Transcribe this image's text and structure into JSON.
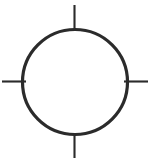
{
  "figure": {
    "name": "circle-with-cardinal-tick-marks",
    "type": "line-drawing",
    "canvas": {
      "width": 150,
      "height": 161,
      "background_color": "#ffffff"
    },
    "stroke_color": "#2b2b2b",
    "fill_color": "none",
    "circle": {
      "name": "outline-circle",
      "center_x": 75,
      "center_y": 82,
      "radius": 52.5,
      "stroke_width": 3.2,
      "fill": "none"
    },
    "ticks": [
      {
        "name": "tick-top",
        "direction": "north",
        "x1": 74.5,
        "y1": 5,
        "x2": 74.5,
        "y2": 31,
        "stroke_width": 2.1,
        "length": 26
      },
      {
        "name": "tick-right",
        "direction": "east",
        "x1": 124,
        "y1": 81.5,
        "x2": 148,
        "y2": 81.5,
        "stroke_width": 2.1,
        "length": 24
      },
      {
        "name": "tick-bottom",
        "direction": "south",
        "x1": 74.5,
        "y1": 133,
        "x2": 74.5,
        "y2": 158,
        "stroke_width": 2.1,
        "length": 25
      },
      {
        "name": "tick-left",
        "direction": "west",
        "x1": 2,
        "y1": 81.5,
        "x2": 26,
        "y2": 81.5,
        "stroke_width": 2.1,
        "length": 24
      }
    ]
  }
}
